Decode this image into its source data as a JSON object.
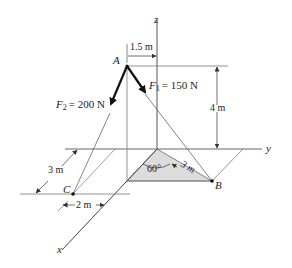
{
  "figure": {
    "type": "3D statics free-body diagram",
    "colors": {
      "line": "#555555",
      "thin_line": "#888888",
      "force": "#111111",
      "shaded_region": "#d9d9d9",
      "text": "#222222"
    },
    "axes": {
      "x_label": "x",
      "y_label": "y",
      "z_label": "z"
    },
    "points": {
      "A": "A",
      "B": "B",
      "C": "C"
    },
    "forces": {
      "F1": {
        "symbol": "F",
        "subscript": "1",
        "value": "= 150 N"
      },
      "F2": {
        "symbol": "F",
        "subscript": "2",
        "value": "= 200 N"
      }
    },
    "dimensions": {
      "a_offset": "1.5 m",
      "height": "4 m",
      "ob_length": "3 m",
      "c_x_offset": "3 m",
      "c_y_offset": "2 m",
      "angle": "60°"
    }
  }
}
